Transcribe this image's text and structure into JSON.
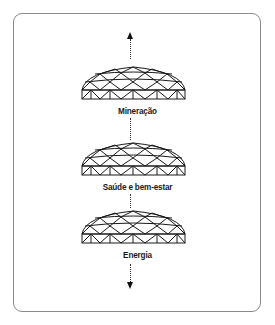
{
  "diagram": {
    "arrows": {
      "top": "up-arrow",
      "bottom": "down-arrow"
    },
    "nodes": [
      {
        "icon": "geodesic-dome-icon",
        "label": "Mineração"
      },
      {
        "icon": "geodesic-dome-icon",
        "label": "Saúde e bem-estar"
      },
      {
        "icon": "geodesic-dome-icon",
        "label": "Energia"
      }
    ],
    "colors": {
      "stroke": "#1a1a1a",
      "frame_border": "#8a8a8a",
      "background": "#ffffff"
    }
  }
}
